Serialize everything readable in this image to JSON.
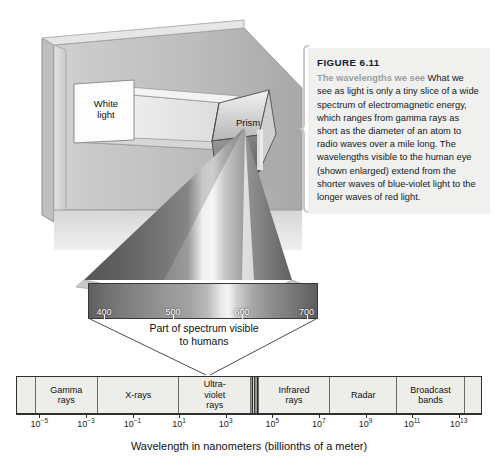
{
  "figure": {
    "number": "FIGURE 6.11",
    "lede": "The wavelengths we see",
    "body": "What we see as light is only a tiny slice of a wide spectrum of electromagnetic energy, which ranges from gamma rays as short as the diameter of an atom to radio waves over a mile long. The wavelengths visible to the human eye (shown enlarged) extend from the shorter waves of blue-violet light to the longer waves of red light."
  },
  "illustration": {
    "white_light_label": "White\nlight",
    "prism_label": "Prism"
  },
  "visible_spectrum": {
    "caption_line1": "Part of spectrum visible",
    "caption_line2": "to humans",
    "tick_labels": [
      "400",
      "500",
      "600",
      "700"
    ],
    "tick_positions_pct": [
      7,
      37,
      67,
      95
    ]
  },
  "colors": {
    "caption_background": "#f0f0ef",
    "caption_lede": "#9aa0a4",
    "figure_number": "#0d2330",
    "band_fill": "#ededea",
    "band_border": "#2f2f2f",
    "axis": "#2f2f2f"
  },
  "chart_data": {
    "type": "bar",
    "xlabel": "Wavelength in nanometers (billionths of a meter)",
    "ylabel": "",
    "xscale": "log10",
    "xlim": [
      -6,
      14
    ],
    "grid": false,
    "legend": "none",
    "tick_labels": [
      "10⁻⁵",
      "10⁻³",
      "10⁻¹",
      "10¹",
      "10³",
      "10⁵",
      "10⁷",
      "10⁹",
      "10¹¹",
      "10¹³"
    ],
    "tick_exponents": [
      -5,
      -3,
      -1,
      1,
      3,
      5,
      7,
      9,
      11,
      13
    ],
    "tick_mantissa": "10",
    "tick_positions_pct": [
      5,
      15,
      25,
      35,
      45,
      55,
      65,
      75,
      85,
      95
    ],
    "bands": [
      {
        "label": "",
        "left_pct": 0,
        "width_pct": 4,
        "visible": false
      },
      {
        "label": "Gamma\nrays",
        "left_pct": 4,
        "width_pct": 13.5,
        "visible": false
      },
      {
        "label": "X-rays",
        "left_pct": 17.5,
        "width_pct": 17.5,
        "visible": false
      },
      {
        "label": "Ultra-\nviolet\nrays",
        "left_pct": 35,
        "width_pct": 15.5,
        "visible": false
      },
      {
        "label": "",
        "left_pct": 50.5,
        "width_pct": 1.6,
        "visible": true
      },
      {
        "label": "Infrared\nrays",
        "left_pct": 52.1,
        "width_pct": 15.4,
        "visible": false
      },
      {
        "label": "Radar",
        "left_pct": 67.5,
        "width_pct": 14.5,
        "visible": false
      },
      {
        "label": "Broadcast\nbands",
        "left_pct": 82,
        "width_pct": 14.5,
        "visible": false
      },
      {
        "label": "",
        "left_pct": 96.5,
        "width_pct": 3.5,
        "visible": false
      }
    ]
  },
  "axis_title": "Wavelength in nanometers (billionths of a meter)"
}
